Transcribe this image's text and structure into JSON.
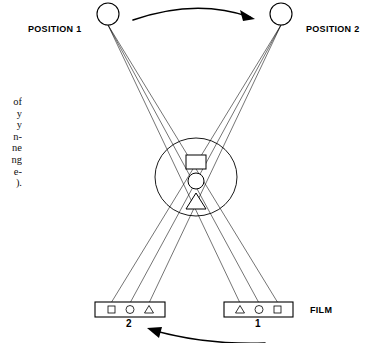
{
  "figure": {
    "labels": {
      "position_1": "POSITION 1",
      "position_2": "POSITION 2",
      "film": "FILM"
    },
    "film_strips": [
      {
        "id": "left",
        "number": "2",
        "markers": [
          "square",
          "circle",
          "triangle"
        ]
      },
      {
        "id": "right",
        "number": "1",
        "markers": [
          "triangle",
          "circle",
          "square"
        ]
      }
    ],
    "objects": [
      {
        "shape": "square",
        "position": "top"
      },
      {
        "shape": "circle",
        "position": "middle"
      },
      {
        "shape": "triangle",
        "position": "bottom"
      }
    ],
    "arrows": [
      {
        "id": "top-arrow",
        "direction": "left-to-right"
      },
      {
        "id": "bottom-arrow",
        "direction": "right-to-left"
      }
    ],
    "caption_lines": [
      "of",
      "y",
      "y",
      "n-",
      "ne",
      "ng",
      "e-",
      ")."
    ],
    "colors": {
      "ink": "#000000",
      "background": "#ffffff"
    }
  }
}
